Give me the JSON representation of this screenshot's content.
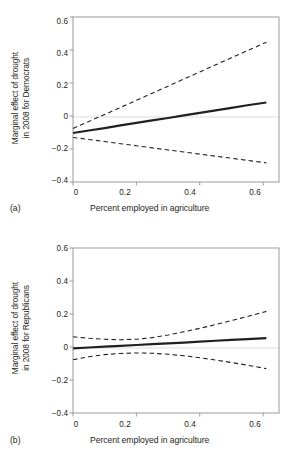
{
  "figure": {
    "background": "#ffffff",
    "line_color": "#231f20",
    "zero_line_color": "#d9d9d9",
    "axis_color": "#939598"
  },
  "panels": [
    {
      "tag": "(a)",
      "ylabel_line1": "Marginal effect of drought",
      "ylabel_line2": "in 2008 for Democrats",
      "xlabel": "Percent employed in agriculture",
      "xticks": [
        "0",
        "0.2",
        "0.4",
        "0.6"
      ],
      "yticks": [
        "0.6",
        "0.4",
        "0.2",
        "0",
        "−0.2",
        "−0.4"
      ]
    },
    {
      "tag": "(b)",
      "ylabel_line1": "Marginal effect of drought",
      "ylabel_line2": "in 2008 for Republicans",
      "xlabel": "Percent employed in agriculture",
      "xticks": [
        "0",
        "0.2",
        "0.4",
        "0.6"
      ],
      "yticks": [
        "0.6",
        "0.4",
        "0.2",
        "0",
        "−0.2",
        "−0.4"
      ]
    }
  ],
  "chart_data": [
    {
      "type": "line",
      "panel": "(a)",
      "title": "Marginal effect of drought in 2008 for Democrats",
      "xlabel": "Percent employed in agriculture",
      "ylabel": "Marginal effect of drought in 2008 for Democrats",
      "xlim": [
        0,
        0.65
      ],
      "ylim": [
        -0.4,
        0.6
      ],
      "xticks": [
        0,
        0.2,
        0.4,
        0.6
      ],
      "yticks": [
        -0.4,
        -0.2,
        0,
        0.2,
        0.4,
        0.6
      ],
      "grid": false,
      "legend": "none",
      "zero_reference_line": 0,
      "x": [
        0.0,
        0.05,
        0.1,
        0.15,
        0.2,
        0.25,
        0.3,
        0.35,
        0.4,
        0.45,
        0.5,
        0.55,
        0.61
      ],
      "series": [
        {
          "name": "Marginal effect (point estimate)",
          "style": "solid",
          "values": [
            -0.103,
            -0.088,
            -0.073,
            -0.057,
            -0.042,
            -0.027,
            -0.012,
            0.004,
            0.019,
            0.034,
            0.049,
            0.065,
            0.082
          ]
        },
        {
          "name": "Upper 95% confidence bound",
          "style": "dashed",
          "values": [
            -0.075,
            -0.033,
            0.009,
            0.052,
            0.095,
            0.138,
            0.181,
            0.224,
            0.267,
            0.31,
            0.353,
            0.396,
            0.447
          ]
        },
        {
          "name": "Lower 95% confidence bound",
          "style": "dashed",
          "values": [
            -0.13,
            -0.142,
            -0.155,
            -0.168,
            -0.18,
            -0.193,
            -0.206,
            -0.218,
            -0.231,
            -0.244,
            -0.256,
            -0.269,
            -0.284
          ]
        }
      ]
    },
    {
      "type": "line",
      "panel": "(b)",
      "title": "Marginal effect of drought in 2008 for Republicans",
      "xlabel": "Percent employed in agriculture",
      "ylabel": "Marginal effect of drought in 2008 for Republicans",
      "xlim": [
        0,
        0.65
      ],
      "ylim": [
        -0.4,
        0.6
      ],
      "xticks": [
        0,
        0.2,
        0.4,
        0.6
      ],
      "yticks": [
        -0.4,
        -0.2,
        0,
        0.2,
        0.4,
        0.6
      ],
      "grid": false,
      "legend": "none",
      "zero_reference_line": 0,
      "x": [
        0.0,
        0.05,
        0.1,
        0.15,
        0.2,
        0.25,
        0.3,
        0.35,
        0.4,
        0.45,
        0.5,
        0.55,
        0.61
      ],
      "series": [
        {
          "name": "Marginal effect (point estimate)",
          "style": "solid",
          "values": [
            -0.008,
            -0.003,
            0.002,
            0.007,
            0.012,
            0.017,
            0.022,
            0.027,
            0.032,
            0.038,
            0.043,
            0.048,
            0.054
          ]
        },
        {
          "name": "Upper 95% confidence bound",
          "style": "dashed",
          "values": [
            0.062,
            0.053,
            0.047,
            0.044,
            0.047,
            0.057,
            0.073,
            0.092,
            0.113,
            0.136,
            0.16,
            0.185,
            0.216
          ]
        },
        {
          "name": "Lower 95% confidence bound",
          "style": "dashed",
          "values": [
            -0.077,
            -0.059,
            -0.046,
            -0.039,
            -0.036,
            -0.038,
            -0.044,
            -0.053,
            -0.065,
            -0.079,
            -0.094,
            -0.11,
            -0.131
          ]
        }
      ]
    }
  ]
}
